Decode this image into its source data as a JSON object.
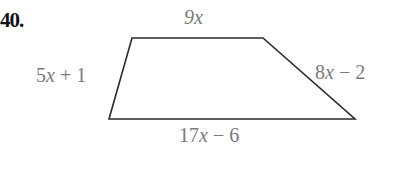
{
  "problem": {
    "number": "40."
  },
  "figure": {
    "shape": "trapezoid",
    "sides": {
      "top": "9x",
      "left": "5x + 1",
      "right": "8x − 2",
      "bottom": "17x − 6"
    },
    "vertices": {
      "top_left": [
        132,
        38
      ],
      "top_right": [
        263,
        38
      ],
      "bottom_right": [
        355,
        119
      ],
      "bottom_left": [
        109,
        119
      ]
    },
    "stroke_color": "#2a2a2a",
    "label_color": "#7a7a7a"
  }
}
